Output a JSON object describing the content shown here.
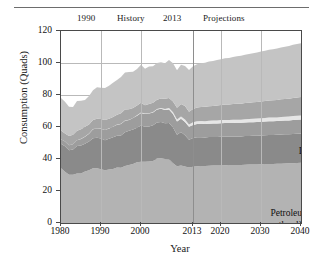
{
  "figure": {
    "top_rule": "horizontal-rule"
  },
  "header": {
    "year_left": "1990",
    "history": "History",
    "year_split": "2013",
    "projections": "Projections"
  },
  "axes": {
    "ylabel": "Consumption (Quads)",
    "xlabel": "Year",
    "yticks": [
      "0",
      "20",
      "40",
      "60",
      "80",
      "100",
      "120"
    ],
    "xticks": [
      "1980",
      "1990",
      "2000",
      "2013",
      "2020",
      "2030",
      "2040"
    ]
  },
  "series_labels": {
    "natural_gas": "Natural gas",
    "renewables": "Renewables",
    "liquid_biofuels": "Liquid biofuels",
    "nuclear": "Nuclear",
    "coal": "Coal",
    "petroleum_line1": "Petroleum and",
    "petroleum_line2": "other liquids"
  },
  "colors": {
    "petroleum": "#b3b3b3",
    "coal": "#8a8a8a",
    "nuclear": "#9d9d9d",
    "liquid_biofuels": "#e6e6e6",
    "renewables": "#a6a6a6",
    "natural_gas": "#c4c4c4",
    "axis": "#4a4a4a",
    "grid": "#b9b9b9",
    "text": "#1a1a1a"
  },
  "chart_data": {
    "type": "area",
    "title": "",
    "xlabel": "Year",
    "ylabel": "Consumption (Quads)",
    "xlim": [
      1980,
      2040
    ],
    "ylim": [
      0,
      120
    ],
    "xticks": [
      1980,
      1990,
      2000,
      2013,
      2020,
      2030,
      2040
    ],
    "yticks": [
      0,
      20,
      40,
      60,
      80,
      100,
      120
    ],
    "grid": true,
    "legend": "in-plot annotations",
    "stacked": true,
    "history_projection_split": 2013,
    "annotations": [
      {
        "text": "1990",
        "position": "above-plot"
      },
      {
        "text": "History",
        "position": "above-plot"
      },
      {
        "text": "2013",
        "position": "above-plot"
      },
      {
        "text": "Projections",
        "position": "above-plot"
      }
    ],
    "x": [
      1980,
      1981,
      1982,
      1983,
      1984,
      1985,
      1986,
      1987,
      1988,
      1989,
      1990,
      1991,
      1992,
      1993,
      1994,
      1995,
      1996,
      1997,
      1998,
      1999,
      2000,
      2001,
      2002,
      2003,
      2004,
      2005,
      2006,
      2007,
      2008,
      2009,
      2010,
      2011,
      2012,
      2013,
      2014,
      2015,
      2016,
      2017,
      2018,
      2019,
      2020,
      2021,
      2022,
      2023,
      2024,
      2025,
      2026,
      2027,
      2028,
      2029,
      2030,
      2031,
      2032,
      2033,
      2034,
      2035,
      2036,
      2037,
      2038,
      2039,
      2040
    ],
    "series": [
      {
        "name": "Petroleum and other liquids",
        "color": "#b3b3b3",
        "values": [
          34.2,
          32.0,
          30.2,
          30.1,
          31.0,
          30.9,
          32.2,
          32.9,
          34.2,
          34.2,
          33.6,
          32.9,
          33.5,
          33.8,
          34.7,
          34.6,
          35.7,
          36.3,
          36.8,
          37.9,
          38.3,
          38.3,
          38.4,
          38.8,
          40.3,
          40.4,
          40.0,
          39.8,
          37.3,
          35.4,
          36.0,
          35.3,
          34.7,
          35.1,
          35.4,
          35.6,
          35.7,
          35.8,
          35.9,
          35.9,
          36.0,
          36.1,
          36.2,
          36.2,
          36.3,
          36.3,
          36.4,
          36.5,
          36.6,
          36.6,
          36.7,
          36.8,
          36.9,
          36.9,
          37.0,
          37.1,
          37.2,
          37.3,
          37.4,
          37.5,
          37.6
        ]
      },
      {
        "name": "Coal",
        "color": "#8a8a8a",
        "values": [
          15.4,
          15.9,
          15.3,
          15.9,
          17.1,
          17.5,
          17.3,
          18.0,
          18.8,
          19.1,
          19.2,
          18.8,
          19.1,
          19.8,
          19.9,
          20.1,
          21.0,
          21.4,
          21.7,
          21.6,
          22.6,
          21.9,
          21.9,
          22.3,
          22.5,
          22.8,
          22.4,
          22.7,
          22.4,
          19.7,
          20.8,
          19.6,
          17.3,
          18.0,
          18.2,
          18.0,
          17.8,
          17.9,
          17.9,
          17.9,
          17.9,
          17.9,
          17.8,
          17.8,
          17.8,
          17.8,
          17.9,
          17.9,
          17.9,
          18.0,
          18.0,
          18.0,
          18.1,
          18.1,
          18.1,
          18.2,
          18.2,
          18.2,
          18.3,
          18.3,
          18.4
        ]
      },
      {
        "name": "Nuclear",
        "color": "#9d9d9d",
        "values": [
          2.7,
          3.0,
          3.1,
          3.2,
          3.6,
          4.1,
          4.4,
          4.9,
          5.6,
          5.7,
          6.1,
          6.4,
          6.5,
          6.5,
          6.8,
          7.2,
          7.2,
          6.7,
          7.1,
          7.6,
          7.9,
          8.0,
          8.1,
          7.9,
          8.2,
          8.2,
          8.2,
          8.5,
          8.4,
          8.4,
          8.4,
          8.3,
          8.1,
          8.2,
          8.3,
          8.4,
          8.4,
          8.4,
          8.4,
          8.4,
          8.5,
          8.5,
          8.5,
          8.5,
          8.5,
          8.5,
          8.5,
          8.5,
          8.5,
          8.5,
          8.6,
          8.6,
          8.6,
          8.6,
          8.6,
          8.6,
          8.6,
          8.6,
          8.7,
          8.7,
          8.7
        ]
      },
      {
        "name": "Liquid biofuels",
        "color": "#e6e6e6",
        "values": [
          0.0,
          0.0,
          0.0,
          0.0,
          0.0,
          0.1,
          0.1,
          0.1,
          0.1,
          0.1,
          0.1,
          0.1,
          0.1,
          0.1,
          0.1,
          0.2,
          0.1,
          0.1,
          0.1,
          0.2,
          0.2,
          0.2,
          0.2,
          0.3,
          0.3,
          0.4,
          0.6,
          0.8,
          1.1,
          1.2,
          1.4,
          1.5,
          1.5,
          1.6,
          1.7,
          1.7,
          1.7,
          1.8,
          1.8,
          1.8,
          1.9,
          1.9,
          1.9,
          2.0,
          2.0,
          2.0,
          2.1,
          2.1,
          2.1,
          2.2,
          2.2,
          2.2,
          2.3,
          2.3,
          2.3,
          2.4,
          2.4,
          2.4,
          2.5,
          2.5,
          2.5
        ]
      },
      {
        "name": "Renewables",
        "color": "#a6a6a6",
        "values": [
          5.5,
          5.0,
          5.7,
          5.9,
          6.0,
          6.0,
          6.1,
          5.7,
          5.6,
          6.0,
          6.0,
          6.1,
          5.9,
          6.1,
          6.1,
          6.5,
          6.9,
          6.6,
          6.1,
          6.1,
          6.1,
          5.2,
          5.7,
          5.8,
          5.8,
          6.0,
          6.4,
          6.4,
          6.8,
          7.4,
          7.7,
          8.5,
          7.9,
          8.3,
          8.6,
          8.8,
          9.0,
          9.1,
          9.2,
          9.4,
          9.5,
          9.6,
          9.7,
          9.8,
          9.9,
          10.0,
          10.1,
          10.2,
          10.3,
          10.4,
          10.5,
          10.6,
          10.7,
          10.8,
          10.9,
          11.0,
          11.1,
          11.2,
          11.3,
          11.4,
          11.5
        ]
      },
      {
        "name": "Natural gas",
        "color": "#c4c4c4",
        "values": [
          20.4,
          19.9,
          18.4,
          17.4,
          18.5,
          17.8,
          16.7,
          17.7,
          18.6,
          19.7,
          19.6,
          20.0,
          20.7,
          21.3,
          21.7,
          22.7,
          23.1,
          23.2,
          22.8,
          22.9,
          23.8,
          22.8,
          23.5,
          22.8,
          22.9,
          22.6,
          22.2,
          23.6,
          23.8,
          23.4,
          24.6,
          25.0,
          26.1,
          26.8,
          27.0,
          27.3,
          27.6,
          27.9,
          28.1,
          28.4,
          28.6,
          28.9,
          29.1,
          29.4,
          29.7,
          29.9,
          30.2,
          30.4,
          30.7,
          30.9,
          31.2,
          31.4,
          31.7,
          31.9,
          32.2,
          32.4,
          32.7,
          32.9,
          33.2,
          33.4,
          33.7
        ]
      }
    ],
    "totals_note": "Stacked totals rise from about 78 Quads in 1980 to about 106 Quads in 2040, with a peak near 100 around 2007 and a dip near 2009."
  }
}
